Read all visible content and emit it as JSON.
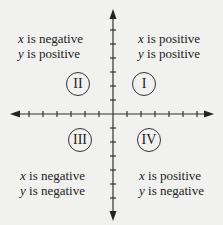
{
  "diagram": {
    "quadrants": [
      {
        "numeral": "I",
        "line1_var": "x",
        "line1_text": " is positive",
        "line2_var": "y",
        "line2_text": " is positive"
      },
      {
        "numeral": "II",
        "line1_var": "x",
        "line1_text": " is negative",
        "line2_var": "y",
        "line2_text": " is positive"
      },
      {
        "numeral": "III",
        "line1_var": "x",
        "line1_text": " is negative",
        "line2_var": "y",
        "line2_text": " is negative"
      },
      {
        "numeral": "IV",
        "line1_var": "x",
        "line1_text": " is positive",
        "line2_var": "y",
        "line2_text": " is negative"
      }
    ],
    "colors": {
      "background": "#f1f1ef",
      "ink": "#222222"
    }
  }
}
